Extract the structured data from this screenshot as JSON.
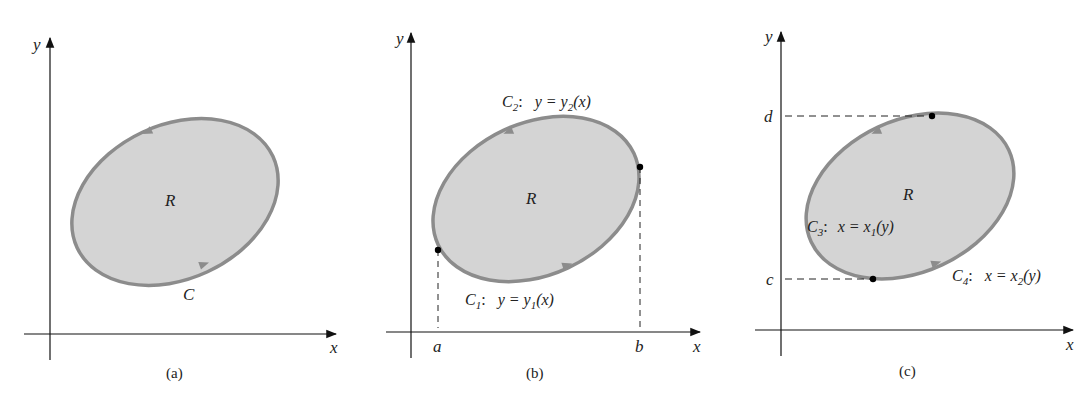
{
  "figure": {
    "panels": [
      {
        "id": "a",
        "caption": "(a)",
        "x_axis_label": "x",
        "y_axis_label": "y",
        "region_label": "R",
        "curve_label": "C"
      },
      {
        "id": "b",
        "caption": "(b)",
        "x_axis_label": "x",
        "y_axis_label": "y",
        "region_label": "R",
        "upper_curve": {
          "name": "C",
          "sub": "2",
          "eq_left": "y = y",
          "eq_sub": "2",
          "eq_right": "(x)"
        },
        "lower_curve": {
          "name": "C",
          "sub": "1",
          "eq_left": "y = y",
          "eq_sub": "1",
          "eq_right": "(x)"
        },
        "x_ticks": [
          "a",
          "b"
        ]
      },
      {
        "id": "c",
        "caption": "(c)",
        "x_axis_label": "x",
        "y_axis_label": "y",
        "region_label": "R",
        "left_curve": {
          "name": "C",
          "sub": "3",
          "eq_left": "x = x",
          "eq_sub": "1",
          "eq_right": "(y)"
        },
        "right_curve": {
          "name": "C",
          "sub": "4",
          "eq_left": "x = x",
          "eq_sub": "2",
          "eq_right": "(y)"
        },
        "y_ticks": [
          "d",
          "c"
        ]
      }
    ],
    "colors": {
      "region_fill": "#d4d4d4",
      "boundary": "#8c8c8c",
      "axis": "#111111",
      "point": "#000000"
    }
  }
}
